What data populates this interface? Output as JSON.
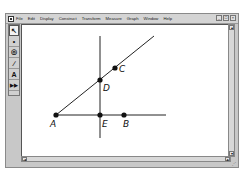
{
  "menubar": {
    "items": [
      "File",
      "Edit",
      "Display",
      "Construct",
      "Transform",
      "Measure",
      "Graph",
      "Window",
      "Help"
    ],
    "window_controls": {
      "minimize": "_",
      "restore": "□",
      "close": "×"
    }
  },
  "toolbox": {
    "tools": [
      {
        "name": "selection-arrow-tool",
        "glyph": "↖",
        "active": true
      },
      {
        "name": "point-tool",
        "glyph": "•",
        "active": false
      },
      {
        "name": "compass-tool",
        "glyph": "◎",
        "active": false
      },
      {
        "name": "straightedge-tool",
        "glyph": "∕",
        "active": false
      },
      {
        "name": "text-tool",
        "glyph": "A",
        "active": false
      },
      {
        "name": "custom-tool",
        "glyph": "▶▶",
        "active": false
      }
    ]
  },
  "figure": {
    "points": [
      {
        "label": "A"
      },
      {
        "label": "B"
      },
      {
        "label": "C"
      },
      {
        "label": "D"
      },
      {
        "label": "E"
      }
    ],
    "objects": [
      {
        "type": "ray",
        "through": [
          "A",
          "C"
        ]
      },
      {
        "type": "ray",
        "through": [
          "A",
          "B"
        ]
      },
      {
        "type": "line",
        "through": [
          "E",
          "D"
        ],
        "note": "perpendicular to AB at E"
      }
    ]
  },
  "scrollbars": {
    "up": "▴",
    "down": "▾",
    "left": "◂",
    "right": "▸"
  }
}
